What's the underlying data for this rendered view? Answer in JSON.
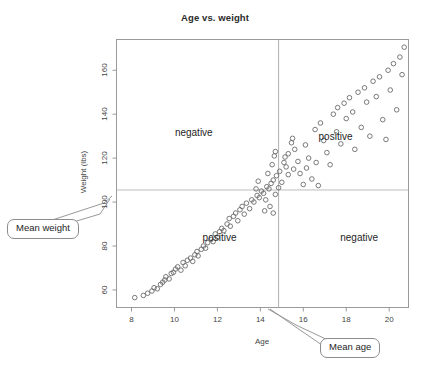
{
  "chart_data": {
    "type": "scatter",
    "title": "Age vs. weight",
    "xlabel": "Age",
    "ylabel": "Weight (lbs)",
    "xlim": [
      7.3,
      20.9
    ],
    "ylim": [
      52,
      174
    ],
    "xticks": [
      8,
      10,
      12,
      14,
      16,
      18,
      20
    ],
    "yticks": [
      60,
      80,
      100,
      120,
      140,
      160
    ],
    "grid": false,
    "legend": null,
    "reference_lines": [
      {
        "name": "mean-age",
        "orientation": "vertical",
        "value": 14.85,
        "label": "Mean age"
      },
      {
        "name": "mean-weight",
        "orientation": "horizontal",
        "value": 105.5,
        "label": "Mean weight"
      }
    ],
    "annotations": [
      {
        "name": "quadrant-top-left",
        "text": "negative",
        "x": 10.9,
        "y": 132
      },
      {
        "name": "quadrant-top-right",
        "text": "positive",
        "x": 17.5,
        "y": 130
      },
      {
        "name": "quadrant-bottom-left",
        "text": "positive",
        "x": 12.1,
        "y": 84
      },
      {
        "name": "quadrant-bottom-right",
        "text": "negative",
        "x": 18.6,
        "y": 84
      }
    ],
    "marker": {
      "shape": "open-circle",
      "radius_px": 3,
      "color": "#6b6b6b"
    },
    "points": [
      [
        8.15,
        56.5
      ],
      [
        8.55,
        57.5
      ],
      [
        8.75,
        58.5
      ],
      [
        8.95,
        59.5
      ],
      [
        9.05,
        61.0
      ],
      [
        9.2,
        60.5
      ],
      [
        9.35,
        62.5
      ],
      [
        9.45,
        63.5
      ],
      [
        9.55,
        64.5
      ],
      [
        9.6,
        66.0
      ],
      [
        9.75,
        65.0
      ],
      [
        9.85,
        67.5
      ],
      [
        9.95,
        68.0
      ],
      [
        10.05,
        69.5
      ],
      [
        10.15,
        70.5
      ],
      [
        10.3,
        69.0
      ],
      [
        10.4,
        72.5
      ],
      [
        10.5,
        71.0
      ],
      [
        10.6,
        73.5
      ],
      [
        10.75,
        74.5
      ],
      [
        10.85,
        73.0
      ],
      [
        10.95,
        76.0
      ],
      [
        11.05,
        77.5
      ],
      [
        11.1,
        75.5
      ],
      [
        11.25,
        78.5
      ],
      [
        11.35,
        80.0
      ],
      [
        11.45,
        79.0
      ],
      [
        11.55,
        81.5
      ],
      [
        11.7,
        83.0
      ],
      [
        11.8,
        82.0
      ],
      [
        11.9,
        85.5
      ],
      [
        12.0,
        84.0
      ],
      [
        12.1,
        86.5
      ],
      [
        12.2,
        88.0
      ],
      [
        12.3,
        87.0
      ],
      [
        12.45,
        90.0
      ],
      [
        12.55,
        92.5
      ],
      [
        12.6,
        89.0
      ],
      [
        12.75,
        93.5
      ],
      [
        12.85,
        95.0
      ],
      [
        12.95,
        91.5
      ],
      [
        13.05,
        96.5
      ],
      [
        13.15,
        98.0
      ],
      [
        13.25,
        94.5
      ],
      [
        13.35,
        99.5
      ],
      [
        13.5,
        97.0
      ],
      [
        13.6,
        101.0
      ],
      [
        13.7,
        100.0
      ],
      [
        13.85,
        103.0
      ],
      [
        13.95,
        102.0
      ],
      [
        14.05,
        105.0
      ],
      [
        14.15,
        104.0
      ],
      [
        14.3,
        107.0
      ],
      [
        14.4,
        106.0
      ],
      [
        14.5,
        108.5
      ],
      [
        14.6,
        110.0
      ],
      [
        14.7,
        103.5
      ],
      [
        14.75,
        112.0
      ],
      [
        14.85,
        106.5
      ],
      [
        14.9,
        114.0
      ],
      [
        15.0,
        109.0
      ],
      [
        15.1,
        118.0
      ],
      [
        15.15,
        120.5
      ],
      [
        15.2,
        116.0
      ],
      [
        15.3,
        122.0
      ],
      [
        15.45,
        127.0
      ],
      [
        15.5,
        129.0
      ],
      [
        15.6,
        124.0
      ],
      [
        15.75,
        118.5
      ],
      [
        15.85,
        113.0
      ],
      [
        16.0,
        108.0
      ],
      [
        16.1,
        126.0
      ],
      [
        16.25,
        120.0
      ],
      [
        16.4,
        110.5
      ],
      [
        16.55,
        133.0
      ],
      [
        16.7,
        107.5
      ],
      [
        16.8,
        136.0
      ],
      [
        16.95,
        128.0
      ],
      [
        17.1,
        122.5
      ],
      [
        17.25,
        117.0
      ],
      [
        17.4,
        140.0
      ],
      [
        17.55,
        132.0
      ],
      [
        17.6,
        143.0
      ],
      [
        17.75,
        126.5
      ],
      [
        17.9,
        145.0
      ],
      [
        18.0,
        138.0
      ],
      [
        18.15,
        147.5
      ],
      [
        18.3,
        141.0
      ],
      [
        18.4,
        124.0
      ],
      [
        18.55,
        150.0
      ],
      [
        18.7,
        134.0
      ],
      [
        18.85,
        152.0
      ],
      [
        18.95,
        145.5
      ],
      [
        19.1,
        130.0
      ],
      [
        19.25,
        155.0
      ],
      [
        19.4,
        148.0
      ],
      [
        19.55,
        157.0
      ],
      [
        19.7,
        137.5
      ],
      [
        19.85,
        128.5
      ],
      [
        19.95,
        160.0
      ],
      [
        20.05,
        151.0
      ],
      [
        20.2,
        163.0
      ],
      [
        20.35,
        142.0
      ],
      [
        20.5,
        166.0
      ],
      [
        20.6,
        158.0
      ],
      [
        20.7,
        170.5
      ],
      [
        15.3,
        112.5
      ],
      [
        15.55,
        115.0
      ],
      [
        16.15,
        115.5
      ],
      [
        16.6,
        118.0
      ],
      [
        14.45,
        98.0
      ],
      [
        14.2,
        96.0
      ],
      [
        13.8,
        106.0
      ],
      [
        14.6,
        95.0
      ],
      [
        14.35,
        113.0
      ],
      [
        14.55,
        117.0
      ],
      [
        14.65,
        121.0
      ],
      [
        14.7,
        123.0
      ],
      [
        13.9,
        109.5
      ],
      [
        14.25,
        101.0
      ]
    ]
  },
  "callouts": {
    "mean_weight_label": "Mean weight",
    "mean_age_label": "Mean age"
  }
}
